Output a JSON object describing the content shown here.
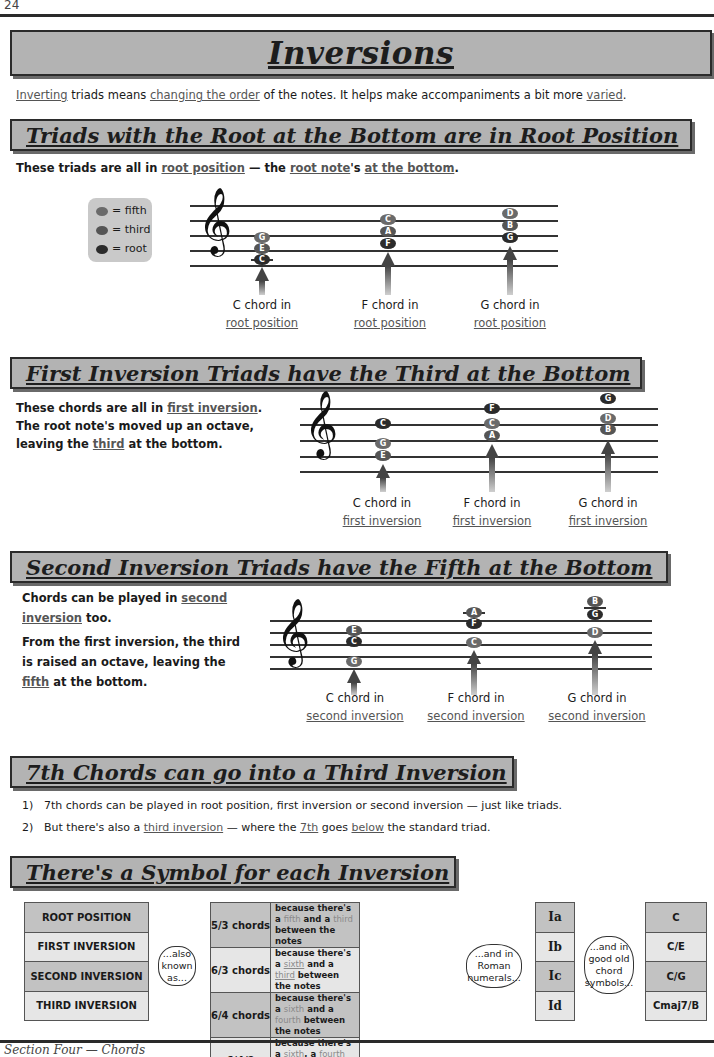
{
  "page": {
    "number": "24",
    "footer": "Section Four — Chords"
  },
  "title": "Inversions",
  "intro": {
    "parts": [
      {
        "text": "Inverting",
        "u": true
      },
      {
        "text": " triads means "
      },
      {
        "text": "changing the order",
        "u": true
      },
      {
        "text": " of the notes.  It helps make accompaniments a bit more "
      },
      {
        "text": "varied",
        "u": true
      },
      {
        "text": "."
      }
    ]
  },
  "sections": {
    "root": {
      "heading": "Triads with the Root at the Bottom are in Root Position",
      "text": {
        "a": "These triads are all in ",
        "b": "root position",
        "c": " — the ",
        "d": "root note",
        "e": "'s ",
        "f": "at the bottom",
        "g": "."
      },
      "legend": {
        "fifth": "= fifth",
        "third": "= third",
        "root": "= root"
      },
      "chords": [
        {
          "label": "C chord in",
          "position": "root position",
          "notes": [
            "C",
            "E",
            "G"
          ]
        },
        {
          "label": "F chord in",
          "position": "root position",
          "notes": [
            "F",
            "A",
            "C"
          ]
        },
        {
          "label": "G chord in",
          "position": "root position",
          "notes": [
            "G",
            "B",
            "D"
          ]
        }
      ]
    },
    "first": {
      "heading": "First Inversion Triads have the Third at the Bottom",
      "text": {
        "l1a": "These chords are all in ",
        "l1b": "first inversion",
        "l1c": ".",
        "l2": "The root note's moved up an octave,",
        "l3a": "leaving the ",
        "l3b": "third",
        "l3c": " at the bottom."
      },
      "chords": [
        {
          "label": "C chord in",
          "position": "first inversion",
          "notes": [
            "E",
            "G",
            "C"
          ]
        },
        {
          "label": "F chord in",
          "position": "first inversion",
          "notes": [
            "A",
            "C",
            "F"
          ]
        },
        {
          "label": "G chord in",
          "position": "first inversion",
          "notes": [
            "B",
            "D",
            "G"
          ]
        }
      ]
    },
    "second": {
      "heading": "Second Inversion Triads have the Fifth at the Bottom",
      "text": {
        "l1a": "Chords can be played in ",
        "l1b": "second",
        "l2a": "inversion",
        "l2b": " too.",
        "l3": "From the first inversion, the third",
        "l4": "is raised an octave, leaving the",
        "l5a": "fifth",
        "l5b": " at the bottom."
      },
      "chords": [
        {
          "label": "C chord in",
          "position": "second inversion",
          "notes": [
            "G",
            "C",
            "E"
          ]
        },
        {
          "label": "F chord in",
          "position": "second inversion",
          "notes": [
            "C",
            "F",
            "A"
          ]
        },
        {
          "label": "G chord in",
          "position": "second inversion",
          "notes": [
            "D",
            "G",
            "B"
          ]
        }
      ]
    },
    "seventh": {
      "heading": "7th Chords can go into a Third Inversion",
      "items": [
        {
          "num": "1)",
          "text": "7th chords can be played in root position, first inversion or second inversion — just like triads."
        },
        {
          "num": "2)",
          "a": "But there's also a ",
          "b": "third inversion",
          "c": " — where the ",
          "d": "7th",
          "e": " goes ",
          "f": "below",
          "g": " the standard triad."
        }
      ]
    },
    "symbols": {
      "heading": "There's a Symbol for each Inversion",
      "positions": [
        "ROOT POSITION",
        "FIRST INVERSION",
        "SECOND INVERSION",
        "THIRD INVERSION"
      ],
      "cloud1": "...also known as...",
      "figures": [
        {
          "name": "5/3 chords",
          "why": [
            "because there's a ",
            "fifth",
            " and a ",
            "third",
            " between the notes"
          ]
        },
        {
          "name": "6/3 chords",
          "why": [
            "because there's a ",
            "sixth",
            " and a ",
            "third",
            " between the notes"
          ]
        },
        {
          "name": "6/4 chords",
          "why": [
            "because there's a ",
            "sixth",
            " and a ",
            "fourth",
            " between the notes"
          ]
        },
        {
          "name": "6/4/2 chords",
          "why": [
            "because there's a ",
            "sixth",
            ", a ",
            "fourth",
            " and a ",
            "second",
            " between the notes"
          ]
        }
      ],
      "cloud2": "...and in Roman numerals...",
      "roman": [
        "Ia",
        "Ib",
        "Ic",
        "Id"
      ],
      "cloud3": "...and in good old chord symbols...",
      "chord_symbols": [
        "C",
        "C/E",
        "C/G",
        "Cmaj7/B"
      ]
    }
  }
}
